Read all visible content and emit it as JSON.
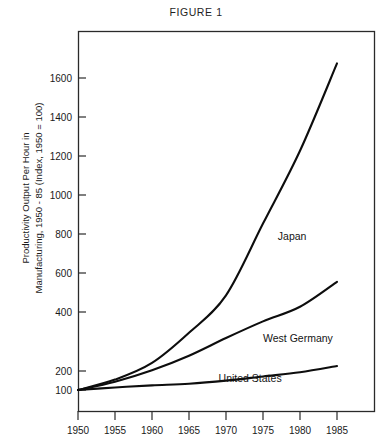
{
  "figure": {
    "title": "FIGURE 1",
    "y_axis_title_line1": "Productivity Output Per Hour in",
    "y_axis_title_line2": "Manufacturing, 1950 - 85 (Index, 1950 = 100)"
  },
  "labels": {
    "japan": "Japan",
    "west_germany": "West Germany",
    "united_states": "United States"
  },
  "ticks": {
    "y": [
      "1600",
      "1400",
      "1200",
      "1000",
      "800",
      "600",
      "400",
      "200",
      "100"
    ],
    "x": [
      "1950",
      "1955",
      "1960",
      "1965",
      "1970",
      "1975",
      "1980",
      "1985"
    ]
  },
  "chart_data": {
    "type": "line",
    "title": "FIGURE 1",
    "xlabel": "",
    "ylabel": "Productivity Output Per Hour in Manufacturing, 1950 - 85 (Index, 1950 = 100)",
    "x": [
      1950,
      1955,
      1960,
      1965,
      1970,
      1975,
      1980,
      1985
    ],
    "xlim": [
      1950,
      1985
    ],
    "ylim": [
      0,
      1780
    ],
    "ytick_values": [
      100,
      200,
      400,
      600,
      800,
      1000,
      1200,
      1400,
      1600
    ],
    "xtick_values": [
      1950,
      1955,
      1960,
      1965,
      1970,
      1975,
      1980,
      1985
    ],
    "grid": false,
    "legend": "inline-labels",
    "series": [
      {
        "name": "Japan",
        "values": [
          100,
          150,
          230,
          375,
          555,
          900,
          1250,
          1670
        ],
        "label_position": {
          "x": 1977,
          "y": 820
        }
      },
      {
        "name": "West Germany",
        "values": [
          100,
          140,
          195,
          265,
          350,
          430,
          500,
          620
        ],
        "label_position": {
          "x": 1975,
          "y": 330
        }
      },
      {
        "name": "United States",
        "values": [
          100,
          112,
          122,
          130,
          145,
          165,
          185,
          215
        ],
        "label_position": {
          "x": 1969,
          "y": 140
        }
      }
    ]
  }
}
